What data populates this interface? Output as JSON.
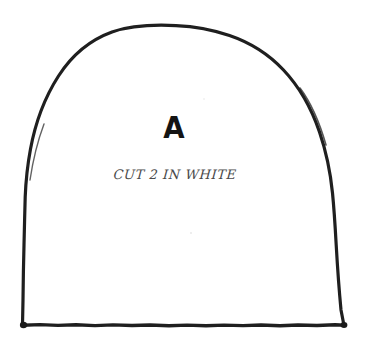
{
  "document": {
    "kind": "hand-drawn sewing pattern piece",
    "background_color": "#ffffff",
    "ink_color": "#1f1f1f",
    "width": 365,
    "height": 349
  },
  "pattern": {
    "piece_letter": "A",
    "cut_instruction": "CUT 2 IN WHITE",
    "shape_name": "arch-outline",
    "shape_description": "tombstone arch: flat base with rounded dome top",
    "stroke_color": "#1f1f1f",
    "stroke_width": 3
  },
  "geometry": {
    "base_left_x": 22,
    "base_right_x": 345,
    "base_y": 325,
    "apex_x": 190,
    "apex_y": 26,
    "shoulder_left_x": 25,
    "shoulder_right_x": 343,
    "shoulder_y": 190
  }
}
